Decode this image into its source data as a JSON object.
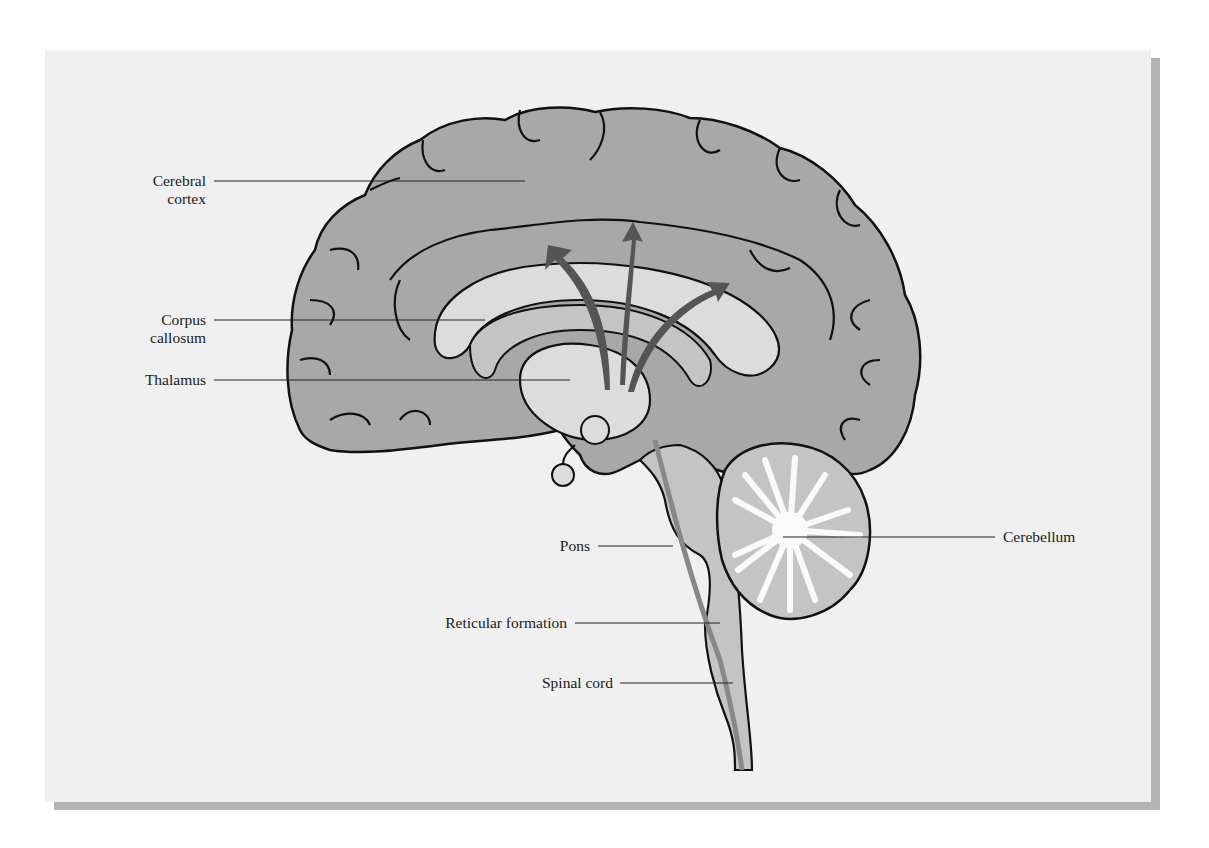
{
  "figure": {
    "colors": {
      "background": "#f0f0f0",
      "shadow": "#b4b4b4",
      "cortex_fill": "#a8a8a8",
      "light_fill": "#dcdcdc",
      "mid_fill": "#c4c4c4",
      "arrow": "#555555",
      "outline": "#111111"
    }
  },
  "labels": {
    "cerebral_cortex": {
      "line1": "Cerebral",
      "line2": "cortex"
    },
    "corpus_callosum": {
      "line1": "Corpus",
      "line2": "callosum"
    },
    "thalamus": "Thalamus",
    "pons": "Pons",
    "reticular_formation": "Reticular formation",
    "spinal_cord": "Spinal cord",
    "cerebellum": "Cerebellum"
  }
}
